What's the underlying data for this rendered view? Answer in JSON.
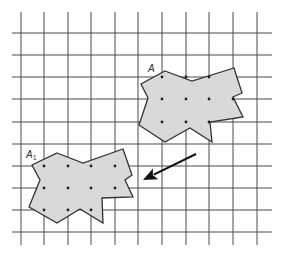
{
  "diagram": {
    "type": "grid-translation",
    "grid": {
      "vertical_x": [
        21,
        44,
        68,
        91,
        115,
        138,
        162,
        186,
        209,
        233,
        257
      ],
      "horizontal_y": [
        33,
        55,
        77,
        99,
        122,
        144,
        166,
        188,
        210,
        232
      ],
      "v_extent": [
        12,
        245
      ],
      "h_extent": [
        12,
        272
      ],
      "color": "#4a4a4a"
    },
    "shapes": [
      {
        "id": "A",
        "label": "A",
        "label_pos": [
          148,
          72
        ],
        "fill": "#d9d9d9",
        "points": [
          [
            165,
            71
          ],
          [
            192,
            81
          ],
          [
            234,
            68
          ],
          [
            242,
            93
          ],
          [
            233,
            97
          ],
          [
            243,
            117
          ],
          [
            210,
            122
          ],
          [
            212,
            142
          ],
          [
            190,
            128
          ],
          [
            165,
            142
          ],
          [
            139,
            125
          ],
          [
            148,
            98
          ],
          [
            141,
            84
          ]
        ],
        "dots": [
          [
            162,
            77
          ],
          [
            186,
            77
          ],
          [
            209,
            77
          ],
          [
            162,
            99
          ],
          [
            186,
            99
          ],
          [
            209,
            99
          ],
          [
            233,
            99
          ],
          [
            162,
            122
          ],
          [
            186,
            122
          ],
          [
            209,
            122
          ]
        ]
      },
      {
        "id": "A1",
        "label": "A",
        "label_sub": "1",
        "label_pos": [
          26,
          158
        ],
        "fill": "#d9d9d9",
        "points": [
          [
            57,
            153
          ],
          [
            83,
            163
          ],
          [
            123,
            149
          ],
          [
            132,
            175
          ],
          [
            125,
            180
          ],
          [
            133,
            197
          ],
          [
            102,
            198
          ],
          [
            103,
            223
          ],
          [
            80,
            209
          ],
          [
            57,
            223
          ],
          [
            29,
            207
          ],
          [
            40,
            180
          ],
          [
            32,
            165
          ]
        ],
        "dots": [
          [
            44,
            166
          ],
          [
            68,
            166
          ],
          [
            91,
            166
          ],
          [
            115,
            166
          ],
          [
            44,
            188
          ],
          [
            68,
            188
          ],
          [
            91,
            188
          ],
          [
            115,
            188
          ],
          [
            44,
            210
          ],
          [
            68,
            210
          ],
          [
            91,
            210
          ]
        ]
      }
    ],
    "arrow": {
      "from": [
        196,
        154
      ],
      "to": [
        143,
        180
      ],
      "color": "#111111"
    }
  }
}
